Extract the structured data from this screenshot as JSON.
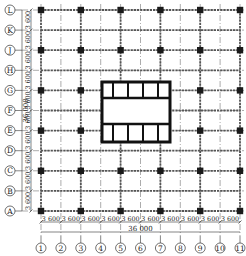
{
  "drawing": {
    "type": "structural-grid-plan",
    "columns": {
      "labels": [
        "1",
        "2",
        "3",
        "4",
        "5",
        "6",
        "7",
        "8",
        "9",
        "10",
        "11"
      ],
      "spacing_label": "3 600",
      "total_label": "36 000"
    },
    "rows": {
      "labels": [
        "L",
        "K",
        "J",
        "H",
        "G",
        "F",
        "E",
        "D",
        "C",
        "B",
        "A"
      ],
      "spacing_label": "3 600",
      "total_label": "36 000"
    },
    "colors": {
      "line": "#1a1a1a",
      "beam": "#555555",
      "axis": "#888888",
      "background": "#ffffff"
    },
    "core": {
      "description": "central core with two rows of four cells",
      "top_cells": 4,
      "bottom_cells": 4
    }
  }
}
